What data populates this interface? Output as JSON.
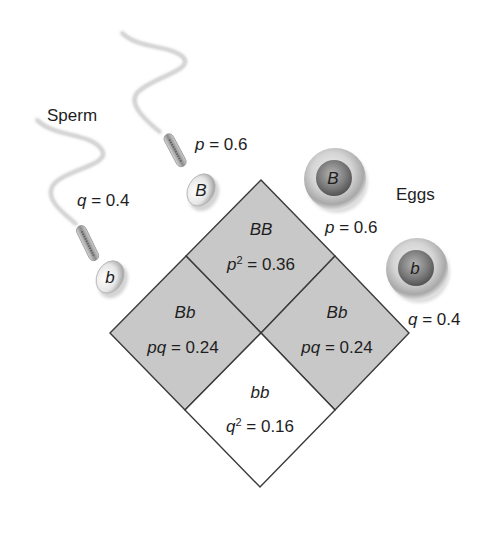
{
  "diagram": {
    "type": "punnett-square-hardy-weinberg",
    "sperm": {
      "title": "Sperm",
      "items": [
        {
          "allele": "B",
          "freq_var": "p",
          "freq_eq": " = 0.6",
          "freq": 0.6
        },
        {
          "allele": "b",
          "freq_var": "q",
          "freq_eq": " = 0.4",
          "freq": 0.4
        }
      ]
    },
    "eggs": {
      "title": "Eggs",
      "items": [
        {
          "allele": "B",
          "freq_var": "p",
          "freq_eq": " = 0.6",
          "freq": 0.6
        },
        {
          "allele": "b",
          "freq_var": "q",
          "freq_eq": " = 0.4",
          "freq": 0.4
        }
      ]
    },
    "cells": {
      "top": {
        "genotype": "BB",
        "expr_var": "p",
        "expr_sup": "2",
        "expr_eq": " = 0.36",
        "value": 0.36,
        "shaded": true
      },
      "left": {
        "genotype": "Bb",
        "expr_var": "pq",
        "expr_sup": "",
        "expr_eq": " = 0.24",
        "value": 0.24,
        "shaded": true
      },
      "right": {
        "genotype": "Bb",
        "expr_var": "pq",
        "expr_sup": "",
        "expr_eq": " = 0.24",
        "value": 0.24,
        "shaded": true
      },
      "bottom": {
        "genotype": "bb",
        "expr_var": "q",
        "expr_sup": "2",
        "expr_eq": " = 0.16",
        "value": 0.16,
        "shaded": false
      }
    },
    "colors": {
      "shaded_fill": "#c8c8c8",
      "unshaded_fill": "#ffffff",
      "border": "#3a3a3a",
      "text": "#1e1e1e"
    }
  }
}
